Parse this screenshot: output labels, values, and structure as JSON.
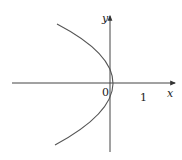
{
  "diagram": {
    "type": "function-graph",
    "equation": "x = 1 - y^2",
    "axes": {
      "x_label": "x",
      "y_label": "y",
      "origin_label": "0",
      "x_tick_label": "1"
    },
    "colors": {
      "curve": "#555555",
      "axis": "#444444",
      "background": "#ffffff"
    }
  }
}
